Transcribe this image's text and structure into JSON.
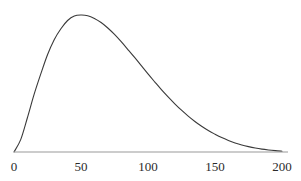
{
  "figure": {
    "width": 301,
    "height": 181,
    "background_color": "#ffffff"
  },
  "style": {
    "curve_color": "#3a3a3a",
    "axis_color": "#9a9a9a",
    "label_color": "#2b2b2b",
    "curve_width": 1.1,
    "axis_width": 1.2
  },
  "geometry": {
    "x_pixel_at_0": 14,
    "x_pixel_at_200": 282,
    "axis_y_pixel": 152,
    "axis_left_pixel": 14,
    "axis_right_pixel": 288,
    "peak_y_pixel": 15
  },
  "axis": {
    "x_ticks": [
      {
        "value": 0,
        "label": "0",
        "px": 14
      },
      {
        "value": 50,
        "label": "50",
        "px": 81
      },
      {
        "value": 100,
        "label": "100",
        "px": 148
      },
      {
        "value": 150,
        "label": "150",
        "px": 215
      },
      {
        "value": 200,
        "label": "200",
        "px": 282
      }
    ],
    "label_top_px": 160,
    "x_axis_title": "",
    "y_axis_title": "",
    "y_ticks": [],
    "grid": false
  },
  "chart_data": {
    "type": "line",
    "title": "",
    "subtitle": "",
    "xlabel": "",
    "ylabel": "",
    "xlim": [
      0,
      200
    ],
    "ylim": [
      0,
      1.0
    ],
    "grid": false,
    "legend": null,
    "legend_position": "none",
    "annotations": [],
    "series": [
      {
        "name": "density",
        "x": [
          0,
          5,
          10,
          15,
          20,
          25,
          30,
          35,
          40,
          45,
          50,
          55,
          60,
          65,
          70,
          75,
          80,
          85,
          90,
          95,
          100,
          105,
          110,
          115,
          120,
          125,
          130,
          135,
          140,
          145,
          150,
          155,
          160,
          165,
          170,
          175,
          180,
          185,
          190,
          195,
          200
        ],
        "y": [
          0.0,
          0.09,
          0.25,
          0.42,
          0.57,
          0.71,
          0.82,
          0.9,
          0.96,
          0.993,
          1.0,
          0.995,
          0.975,
          0.945,
          0.905,
          0.858,
          0.805,
          0.748,
          0.69,
          0.63,
          0.57,
          0.512,
          0.455,
          0.402,
          0.352,
          0.305,
          0.262,
          0.223,
          0.188,
          0.157,
          0.13,
          0.105,
          0.084,
          0.066,
          0.051,
          0.039,
          0.029,
          0.021,
          0.015,
          0.01,
          0.006
        ]
      }
    ]
  }
}
